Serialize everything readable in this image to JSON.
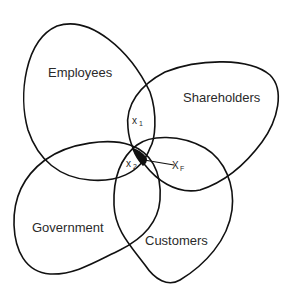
{
  "diagram": {
    "title": "",
    "sets": [
      {
        "id": "employees",
        "label": "Employees"
      },
      {
        "id": "shareholders",
        "label": "Shareholders"
      },
      {
        "id": "government",
        "label": "Government"
      },
      {
        "id": "customers",
        "label": "Customers"
      }
    ],
    "points": [
      {
        "id": "x1",
        "symbol": "x",
        "subscript": "1"
      },
      {
        "id": "x2",
        "symbol": "x",
        "subscript": "2"
      },
      {
        "id": "xF",
        "symbol": "X",
        "subscript": "F"
      }
    ],
    "colors": {
      "stroke": "#111111",
      "text": "#2a2a2a",
      "background": "#ffffff",
      "shared_region_fill": "#111111"
    }
  }
}
